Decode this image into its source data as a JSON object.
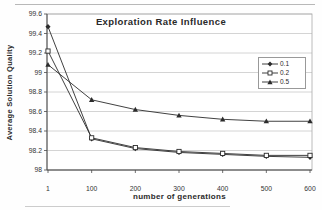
{
  "chart_data": {
    "type": "line",
    "title": "Exploration Rate Influence",
    "xlabel": "number of generations",
    "ylabel": "Average Solution Quality",
    "categories": [
      1,
      100,
      200,
      300,
      400,
      500,
      600
    ],
    "xticks": [
      "1",
      "100",
      "200",
      "300",
      "400",
      "500",
      "600"
    ],
    "yticks": [
      "99.6",
      "99.4",
      "99.2",
      "99",
      "98.8",
      "98.6",
      "98.4",
      "98.2",
      "98"
    ],
    "ylim": [
      98,
      99.6
    ],
    "ytick_step": 0.2,
    "grid": "horizontal",
    "legend_position": "inside-right",
    "series": [
      {
        "name": "0.1",
        "marker": "diamond",
        "values": [
          99.47,
          98.32,
          98.22,
          98.18,
          98.16,
          98.14,
          98.13
        ]
      },
      {
        "name": "0.2",
        "marker": "square",
        "values": [
          99.22,
          98.33,
          98.23,
          98.19,
          98.17,
          98.15,
          98.15
        ]
      },
      {
        "name": "0.5",
        "marker": "triangle",
        "values": [
          99.08,
          98.72,
          98.62,
          98.56,
          98.52,
          98.5,
          98.5
        ]
      }
    ]
  },
  "colors": {
    "line": "#2b2b2b",
    "grid": "#c9c9c9",
    "axis": "#4a4a4a",
    "plot_border": "#aaaaaa",
    "text": "#333333",
    "plot_bg": "#ffffff"
  }
}
